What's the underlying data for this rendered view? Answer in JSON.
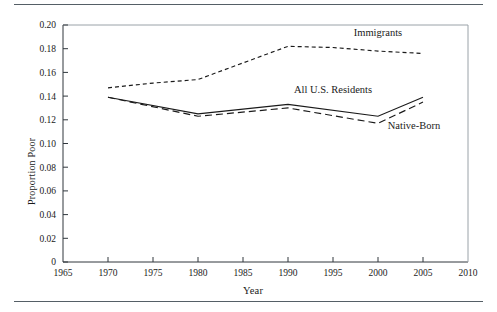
{
  "figure": {
    "rule_color": "#555f66"
  },
  "chart_data": {
    "type": "line",
    "title": "",
    "xlabel": "Year",
    "ylabel": "Proportion Poor",
    "xlim": [
      1965,
      2010
    ],
    "ylim": [
      0,
      0.2
    ],
    "grid": false,
    "legend_position": "inline-annotations",
    "xticks": [
      1965,
      1970,
      1975,
      1980,
      1985,
      1990,
      1995,
      2000,
      2005,
      2010
    ],
    "xtick_labels": [
      "1965",
      "1970",
      "1975",
      "1980",
      "1985",
      "1990",
      "1995",
      "2000",
      "2005",
      "2010"
    ],
    "yticks": [
      0,
      0.02,
      0.04,
      0.06,
      0.08,
      0.1,
      0.12,
      0.14,
      0.16,
      0.18,
      0.2
    ],
    "ytick_labels": [
      "0",
      "0.02",
      "0.04",
      "0.06",
      "0.08",
      "0.10",
      "0.12",
      "0.14",
      "0.16",
      "0.18",
      "0.20"
    ],
    "series": [
      {
        "name": "Immigrants",
        "style": "dotted",
        "x": [
          1970,
          1975,
          1980,
          1990,
          1995,
          2000,
          2005
        ],
        "values": [
          0.147,
          0.151,
          0.154,
          0.182,
          0.181,
          0.178,
          0.176
        ],
        "label_x": 2000,
        "label_y": 0.191
      },
      {
        "name": "All U.S. Residents",
        "style": "solid",
        "x": [
          1970,
          1980,
          1990,
          2000,
          2005
        ],
        "values": [
          0.139,
          0.125,
          0.133,
          0.123,
          0.139
        ],
        "label_x": 1995,
        "label_y": 0.143
      },
      {
        "name": "Native-Born",
        "style": "dashed",
        "x": [
          1970,
          1980,
          1990,
          2000,
          2005
        ],
        "values": [
          0.139,
          0.123,
          0.13,
          0.117,
          0.135
        ],
        "label_x": 2004,
        "label_y": 0.112
      }
    ]
  }
}
